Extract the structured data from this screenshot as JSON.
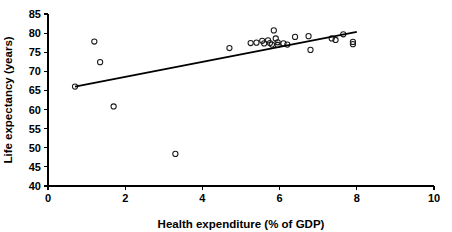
{
  "chart_data": {
    "type": "scatter",
    "title": "",
    "xlabel": "Health expenditure (% of GDP)",
    "ylabel": "Life expectancy (years)",
    "xlim": [
      0,
      10
    ],
    "ylim": [
      40,
      85
    ],
    "xticks": [
      0,
      2,
      4,
      6,
      8,
      10
    ],
    "yticks": [
      40,
      45,
      50,
      55,
      60,
      65,
      70,
      75,
      80,
      85
    ],
    "xtick_labels": [
      "0",
      "2",
      "4",
      "6",
      "8",
      "10"
    ],
    "ytick_labels": [
      "40",
      "45",
      "50",
      "55",
      "60",
      "65",
      "70",
      "75",
      "80",
      "85"
    ],
    "grid": false,
    "legend": false,
    "marker": "open-circle",
    "points": [
      {
        "x": 0.7,
        "y": 66.0
      },
      {
        "x": 1.2,
        "y": 77.8
      },
      {
        "x": 1.35,
        "y": 72.4
      },
      {
        "x": 1.7,
        "y": 60.8
      },
      {
        "x": 3.3,
        "y": 48.4
      },
      {
        "x": 4.7,
        "y": 76.1
      },
      {
        "x": 5.25,
        "y": 77.4
      },
      {
        "x": 5.4,
        "y": 77.5
      },
      {
        "x": 5.55,
        "y": 78.0
      },
      {
        "x": 5.6,
        "y": 77.3
      },
      {
        "x": 5.7,
        "y": 78.1
      },
      {
        "x": 5.75,
        "y": 77.4
      },
      {
        "x": 5.8,
        "y": 77.0
      },
      {
        "x": 5.85,
        "y": 80.7
      },
      {
        "x": 5.9,
        "y": 78.6
      },
      {
        "x": 5.95,
        "y": 77.6
      },
      {
        "x": 5.95,
        "y": 76.9
      },
      {
        "x": 6.1,
        "y": 77.3
      },
      {
        "x": 6.2,
        "y": 77.0
      },
      {
        "x": 6.4,
        "y": 79.0
      },
      {
        "x": 6.75,
        "y": 79.2
      },
      {
        "x": 6.8,
        "y": 75.6
      },
      {
        "x": 7.35,
        "y": 78.6
      },
      {
        "x": 7.45,
        "y": 78.2
      },
      {
        "x": 7.65,
        "y": 79.7
      },
      {
        "x": 7.9,
        "y": 77.7
      },
      {
        "x": 7.9,
        "y": 77.1
      }
    ],
    "trend_line": {
      "type": "linear-fit",
      "x_start": 0.7,
      "y_start": 66.0,
      "x_end": 8.0,
      "y_end": 80.3
    }
  }
}
